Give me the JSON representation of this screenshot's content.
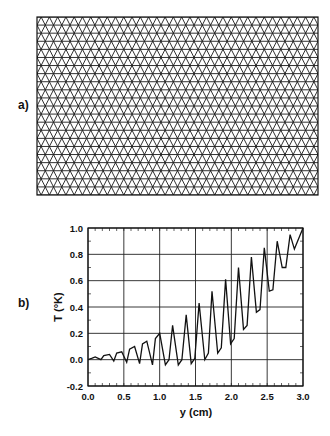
{
  "panels": {
    "a": {
      "label": "a)"
    },
    "b": {
      "label": "b)"
    }
  },
  "mesh": {
    "description": "structured triangular finite-element mesh",
    "box": {
      "x": 37,
      "y": 17,
      "width": 281,
      "height": 178
    },
    "columns": 34,
    "rows": 22,
    "line_color": "#1a1a1a"
  },
  "chart_data": {
    "type": "line",
    "title": "",
    "xlabel": "y (cm)",
    "ylabel": "T (°K)",
    "xlim": [
      0.0,
      3.0
    ],
    "ylim": [
      -0.2,
      1.0
    ],
    "grid": true,
    "legend": "none",
    "x_ticks": [
      "0.0",
      "0.5",
      "1.0",
      "1.5",
      "2.0",
      "2.5",
      "3.0"
    ],
    "y_ticks": [
      "-0.2",
      "0.0",
      "0.2",
      "0.4",
      "0.6",
      "0.8",
      "1.0"
    ],
    "series": [
      {
        "name": "T",
        "x": [
          0.0,
          0.05,
          0.1,
          0.18,
          0.22,
          0.3,
          0.36,
          0.4,
          0.47,
          0.54,
          0.58,
          0.65,
          0.72,
          0.76,
          0.82,
          0.9,
          0.94,
          1.0,
          1.08,
          1.13,
          1.18,
          1.26,
          1.31,
          1.37,
          1.44,
          1.49,
          1.55,
          1.63,
          1.68,
          1.73,
          1.81,
          1.86,
          1.92,
          1.99,
          2.04,
          2.1,
          2.17,
          2.22,
          2.28,
          2.35,
          2.4,
          2.46,
          2.53,
          2.58,
          2.64,
          2.71,
          2.76,
          2.82,
          2.88,
          3.0
        ],
        "values": [
          0.0,
          0.01,
          0.02,
          0.0,
          0.03,
          0.04,
          -0.01,
          0.05,
          0.06,
          -0.02,
          0.08,
          0.1,
          -0.03,
          0.12,
          0.14,
          -0.04,
          0.16,
          0.2,
          -0.04,
          0.0,
          0.26,
          -0.04,
          0.0,
          0.34,
          -0.03,
          0.01,
          0.43,
          0.0,
          0.05,
          0.52,
          0.05,
          0.09,
          0.61,
          0.12,
          0.16,
          0.7,
          0.23,
          0.26,
          0.78,
          0.36,
          0.38,
          0.85,
          0.52,
          0.53,
          0.9,
          0.7,
          0.7,
          0.95,
          0.84,
          1.0
        ]
      }
    ]
  }
}
